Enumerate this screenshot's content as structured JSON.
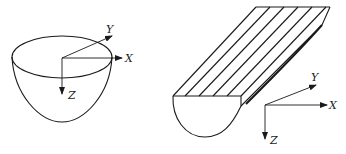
{
  "figures": [
    {
      "name": "paraboloid-bowl",
      "axes": {
        "x_label": "X",
        "y_label": "Y",
        "z_label": "Z"
      }
    },
    {
      "name": "parabolic-trough",
      "hatch_lines": 5,
      "axes": {
        "x_label": "X",
        "y_label": "Y",
        "z_label": "Z"
      }
    }
  ],
  "colors": {
    "stroke": "#1a1a1a",
    "background": "#ffffff"
  }
}
